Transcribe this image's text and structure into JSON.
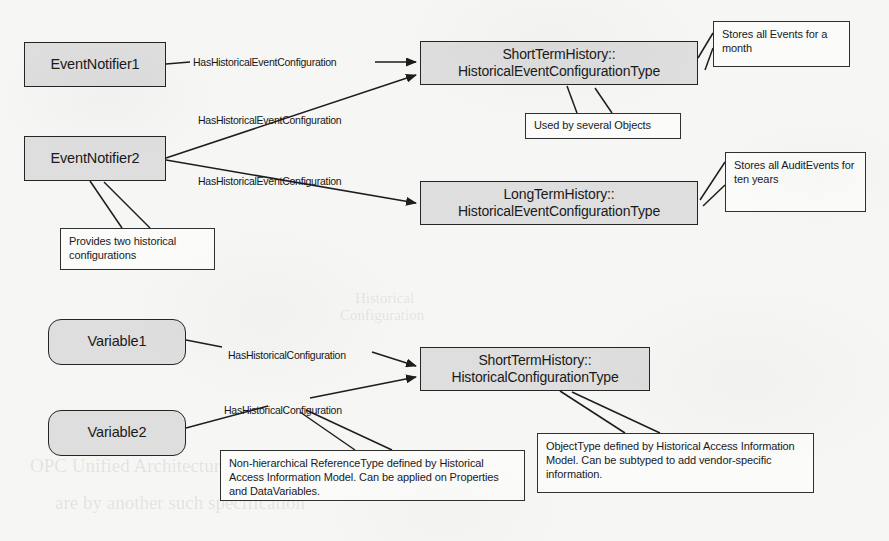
{
  "diagram": {
    "background_color": "#f6f6f4",
    "node_fill": "#dedede",
    "note_fill": "#fbfbfa",
    "stroke_color": "#252525"
  },
  "nodes": [
    {
      "id": "event-notifier-1",
      "label": "EventNotifier1",
      "shape": "rect",
      "x": 24,
      "y": 42,
      "w": 142,
      "h": 45,
      "font_size": 14.5
    },
    {
      "id": "event-notifier-2",
      "label": "EventNotifier2",
      "shape": "rect",
      "x": 24,
      "y": 136,
      "w": 142,
      "h": 45,
      "font_size": 14.5
    },
    {
      "id": "short-term-history-event-config-type",
      "label": "ShortTermHistory::\nHistoricalEventConfigurationType",
      "shape": "rect",
      "x": 420,
      "y": 41,
      "w": 278,
      "h": 44,
      "font_size": 14
    },
    {
      "id": "long-term-history-event-config-type",
      "label": "LongTermHistory::\nHistoricalEventConfigurationType",
      "shape": "rect",
      "x": 420,
      "y": 181,
      "w": 278,
      "h": 44,
      "font_size": 14
    },
    {
      "id": "variable-1",
      "label": "Variable1",
      "shape": "rounded",
      "x": 48,
      "y": 319,
      "w": 138,
      "h": 46,
      "font_size": 14.5
    },
    {
      "id": "variable-2",
      "label": "Variable2",
      "shape": "rounded",
      "x": 48,
      "y": 410,
      "w": 138,
      "h": 46,
      "font_size": 14.5
    },
    {
      "id": "short-term-history-config-type",
      "label": "ShortTermHistory::\nHistoricalConfigurationType",
      "shape": "rect",
      "x": 420,
      "y": 347,
      "w": 230,
      "h": 44,
      "font_size": 14
    }
  ],
  "edge_labels": [
    {
      "id": "label-has-historical-event-configuration-1",
      "text": "HasHistoricalEventConfiguration",
      "x": 193,
      "y": 56,
      "font_size": 10.5
    },
    {
      "id": "label-has-historical-event-configuration-2",
      "text": "HasHistoricalEventConfiguration",
      "x": 198,
      "y": 114,
      "font_size": 10.5
    },
    {
      "id": "label-has-historical-event-configuration-3",
      "text": "HasHistoricalEventConfiguration",
      "x": 198,
      "y": 175,
      "font_size": 10.5
    },
    {
      "id": "label-has-historical-configuration-1",
      "text": "HasHistoricalConfiguration",
      "x": 228,
      "y": 349,
      "font_size": 10.5
    },
    {
      "id": "label-has-historical-configuration-2",
      "text": "HasHistoricalConfiguration",
      "x": 224,
      "y": 404,
      "font_size": 10.5
    }
  ],
  "notes": [
    {
      "id": "note-stores-all-events",
      "text": "Stores all Events for a month",
      "x": 713,
      "y": 21,
      "w": 137,
      "h": 46,
      "font_size": 11
    },
    {
      "id": "note-used-by-several-objects",
      "text": "Used by several Objects",
      "x": 525,
      "y": 113,
      "w": 156,
      "h": 26,
      "font_size": 11
    },
    {
      "id": "note-stores-all-auditevents",
      "text": "Stores all AuditEvents for ten years",
      "x": 725,
      "y": 152,
      "w": 141,
      "h": 60,
      "font_size": 11
    },
    {
      "id": "note-provides-two-historical-configurations",
      "text": "Provides two historical configurations",
      "x": 60,
      "y": 228,
      "w": 155,
      "h": 42,
      "font_size": 11
    },
    {
      "id": "note-non-hierarchical-referencetype",
      "text": "Non-hierarchical ReferenceType defined by Historical Access Information Model. Can be applied on Properties and DataVariables.",
      "x": 220,
      "y": 450,
      "w": 305,
      "h": 51,
      "font_size": 11
    },
    {
      "id": "note-objecttype-defined-by-ham",
      "text": "ObjectType defined by Historical Access Information Model. Can be subtyped to add vendor-specific information.",
      "x": 537,
      "y": 433,
      "w": 277,
      "h": 60,
      "font_size": 11
    }
  ],
  "bleed_through": [
    {
      "id": "bleed-1",
      "text": "Historical",
      "x": 355,
      "y": 290,
      "font_size": 15
    },
    {
      "id": "bleed-2",
      "text": "Configuration",
      "x": 340,
      "y": 307,
      "font_size": 15
    },
    {
      "id": "bleed-3",
      "text": "OPC Unified Architecture",
      "x": 30,
      "y": 455,
      "font_size": 19
    },
    {
      "id": "bleed-4",
      "text": "are by another such specification",
      "x": 55,
      "y": 492,
      "font_size": 19
    }
  ]
}
